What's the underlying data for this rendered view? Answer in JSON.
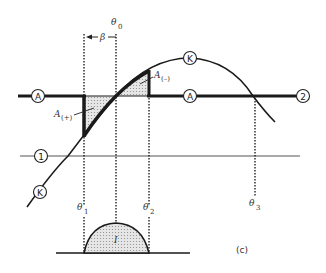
{
  "figure": {
    "panel_label": "(c)",
    "colors": {
      "line": "#1a1a1a",
      "hatch_fill": "#cfcfcf",
      "background": "#ffffff"
    },
    "curves": {
      "A": {
        "marker": "A",
        "end_marker": "2"
      },
      "K": {
        "marker": "K"
      },
      "one": {
        "marker": "1"
      }
    },
    "angles": {
      "theta0": {
        "symbol": "θ",
        "sub": "0"
      },
      "theta1": {
        "symbol": "θ",
        "sub": "1"
      },
      "theta2": {
        "symbol": "θ",
        "sub": "2"
      },
      "theta3": {
        "symbol": "θ",
        "sub": "3"
      },
      "beta": "β"
    },
    "areas": {
      "a_plus": {
        "symbol": "A",
        "sub": "(+)"
      },
      "a_minus": {
        "symbol": "A",
        "sub": "(–)"
      }
    },
    "current_pulse": {
      "label": "I"
    }
  }
}
